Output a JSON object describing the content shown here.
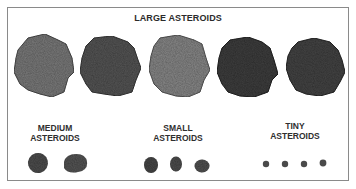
{
  "title": "LARGE ASTEROIDS",
  "groups": {
    "medium": {
      "line1": "MEDIUM",
      "line2": "ASTEROIDS",
      "count": 2
    },
    "small": {
      "line1": "SMALL",
      "line2": "ASTEROIDS",
      "count": 3
    },
    "tiny": {
      "line1": "TINY",
      "line2": "ASTEROIDS",
      "count": 4
    }
  },
  "large_count": 5,
  "colors": {
    "frame": "#8a8a8a",
    "rock_light": "#7d7d7d",
    "rock_dark": "#3f3f3f",
    "text": "#2b2b2b"
  }
}
